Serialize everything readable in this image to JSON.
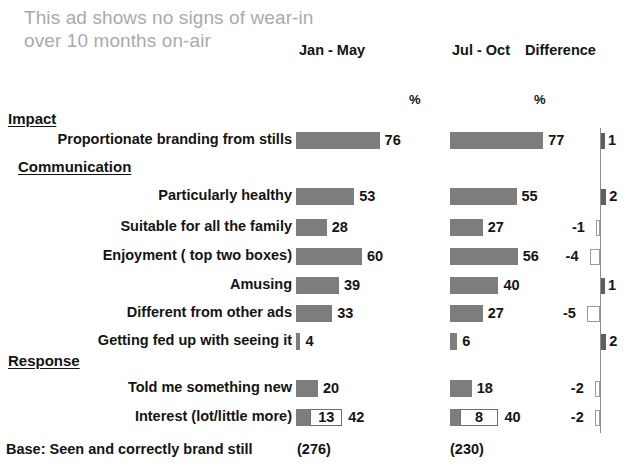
{
  "title": "This ad shows no signs of wear-in over 10 months on-air",
  "headers": {
    "col1": "Jan - May",
    "col2": "Jul - Oct",
    "col3": "Difference",
    "unit1": "%",
    "unit2": "%"
  },
  "sections": [
    {
      "label": "Impact"
    },
    {
      "label": "Communication"
    },
    {
      "label": "Response"
    }
  ],
  "base": {
    "label": "Base: Seen and correctly brand still",
    "col1": "(276)",
    "col2": "(230)"
  },
  "colors": {
    "bar_fill": "#7d7d7d",
    "bar_outline": "#6e6e6e",
    "title_gray": "#aaaaaa",
    "text": "#141414",
    "axis": "#8e8e8e"
  },
  "chart_data": {
    "type": "bar",
    "title": "This ad shows no signs of wear-in over 10 months on-air",
    "xlabel": "",
    "ylabel": "",
    "unit": "%",
    "orientation": "horizontal",
    "series": [
      {
        "name": "Jan - May"
      },
      {
        "name": "Jul - Oct"
      },
      {
        "name": "Difference"
      }
    ],
    "sections": [
      "Impact",
      "Communication",
      "Response"
    ],
    "rows": [
      {
        "section": "Impact",
        "label": "Proportionate branding from stills",
        "jan_may": 76,
        "jul_oct": 77,
        "difference": 1
      },
      {
        "section": "Communication",
        "label": "Particularly healthy",
        "jan_may": 53,
        "jul_oct": 55,
        "difference": 2
      },
      {
        "section": "Communication",
        "label": "Suitable for all the family",
        "jan_may": 28,
        "jul_oct": 27,
        "difference": -1
      },
      {
        "section": "Communication",
        "label": "Enjoyment ( top two boxes)",
        "jan_may": 60,
        "jul_oct": 56,
        "difference": -4
      },
      {
        "section": "Communication",
        "label": "Amusing",
        "jan_may": 39,
        "jul_oct": 40,
        "difference": 1
      },
      {
        "section": "Communication",
        "label": "Different from other ads",
        "jan_may": 33,
        "jul_oct": 27,
        "difference": -5
      },
      {
        "section": "Communication",
        "label": "Getting fed up with seeing it",
        "jan_may": 4,
        "jul_oct": 6,
        "difference": 2
      },
      {
        "section": "Response",
        "label": "Told me something new",
        "jan_may": 20,
        "jul_oct": 18,
        "difference": -2
      },
      {
        "section": "Response",
        "label": "Interest (lot/little more)",
        "jan_may": 42,
        "jan_may_segment": 13,
        "jul_oct": 40,
        "jul_oct_segment": 8,
        "difference": -2,
        "stacked": true
      }
    ],
    "base": {
      "jan_may": "(276)",
      "jul_oct": "(230)"
    }
  },
  "rows": [
    {
      "label": "Proportionate branding from stills",
      "v1": "76",
      "v2": "77",
      "d": "1"
    },
    {
      "label": "Particularly healthy",
      "v1": "53",
      "v2": "55",
      "d": "2"
    },
    {
      "label": "Suitable for all the family",
      "v1": "28",
      "v2": "27",
      "d": "-1"
    },
    {
      "label": "Enjoyment ( top two boxes)",
      "v1": "60",
      "v2": "56",
      "d": "-4"
    },
    {
      "label": "Amusing",
      "v1": "39",
      "v2": "40",
      "d": "1"
    },
    {
      "label": "Different from other ads",
      "v1": "33",
      "v2": "27",
      "d": "-5"
    },
    {
      "label": "Getting fed up with seeing it",
      "v1": "4",
      "v2": "6",
      "d": "2"
    },
    {
      "label": "Told me something new",
      "v1": "20",
      "v2": "18",
      "d": "-2"
    },
    {
      "label": "Interest (lot/little more)",
      "v1": "42",
      "v2": "40",
      "d": "-2",
      "s1": "13",
      "s2": "8"
    }
  ]
}
